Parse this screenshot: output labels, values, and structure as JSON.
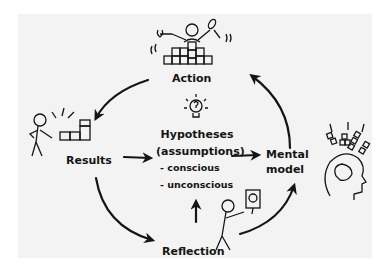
{
  "diagram": {
    "colors": {
      "background": "#f3f3f3",
      "ink": "#151515",
      "page": "#ffffff"
    },
    "nodes": {
      "action": {
        "label": "Action",
        "icon": "person-building-blocks-with-tools-icon"
      },
      "results": {
        "label": "Results",
        "icon": "person-looking-at-blocks-icon"
      },
      "hypotheses": {
        "title": "Hypotheses",
        "subtitle": "(assumptions)",
        "items": [
          "- conscious",
          "- unconscious"
        ],
        "icon": "lightbulb-question-icon"
      },
      "mental_model": {
        "label_line1": "Mental",
        "label_line2": "model",
        "icon": "head-with-blocks-icon"
      },
      "reflection": {
        "label": "Reflection",
        "icon": "person-holding-mirror-icon"
      }
    },
    "edges": [
      {
        "from": "Action",
        "to": "Results"
      },
      {
        "from": "Results",
        "to": "Hypotheses"
      },
      {
        "from": "Hypotheses",
        "to": "Mental model"
      },
      {
        "from": "Mental model",
        "to": "Action"
      },
      {
        "from": "Results",
        "to": "Reflection"
      },
      {
        "from": "Reflection",
        "to": "Mental model"
      },
      {
        "from": "Reflection",
        "to": "Hypotheses"
      }
    ]
  }
}
